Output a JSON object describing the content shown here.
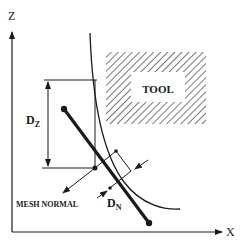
{
  "diagram": {
    "axes": {
      "vertical_label": "Z",
      "horizontal_label": "X"
    },
    "tool_label": "TOOL",
    "dz_label": {
      "main": "D",
      "sub": "Z"
    },
    "dn_label": {
      "main": "D",
      "sub": "N"
    },
    "mesh_normal_label": "MESH NORMAL",
    "colors": {
      "ink": "#1a1a1a",
      "hatch": "#555555",
      "background": "#ffffff"
    }
  }
}
